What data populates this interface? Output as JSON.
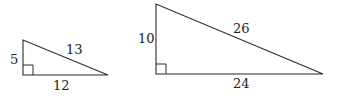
{
  "diagram": {
    "triangles": [
      {
        "id": "small",
        "vertices": {
          "top": [
            23,
            40
          ],
          "right_angle": [
            23,
            75
          ],
          "right": [
            108,
            75
          ]
        },
        "right_angle_size": 10,
        "labels": {
          "leg_vertical": "5",
          "hypotenuse": "13",
          "leg_horizontal": "12"
        },
        "label_positions": {
          "leg_vertical": [
            10,
            64
          ],
          "hypotenuse": [
            66,
            54
          ],
          "leg_horizontal": [
            53,
            90
          ]
        }
      },
      {
        "id": "large",
        "vertices": {
          "top": [
            156,
            4
          ],
          "right_angle": [
            156,
            74
          ],
          "right": [
            323,
            74
          ]
        },
        "right_angle_size": 10,
        "labels": {
          "leg_vertical": "10",
          "hypotenuse": "26",
          "leg_horizontal": "24"
        },
        "label_positions": {
          "leg_vertical": [
            138,
            43
          ],
          "hypotenuse": [
            233,
            33
          ],
          "leg_horizontal": [
            233,
            88
          ]
        }
      }
    ],
    "colors": {
      "stroke": "#2a2a2a",
      "text": "#222222",
      "background": "#ffffff"
    }
  }
}
